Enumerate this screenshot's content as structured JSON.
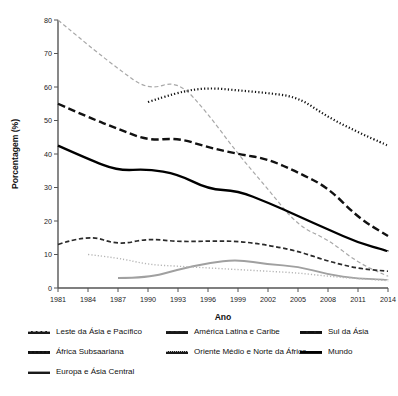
{
  "chart_data": {
    "type": "line",
    "title": "",
    "xlabel": "Ano",
    "ylabel": "Porcentagem (%)",
    "x": [
      1981,
      1984,
      1987,
      1990,
      1993,
      1996,
      1999,
      2002,
      2005,
      2008,
      2011,
      2014
    ],
    "xticklabels": [
      "1981",
      "1984",
      "1987",
      "1990",
      "1993",
      "1996",
      "1999",
      "2002",
      "2005",
      "2008",
      "2011",
      "2014"
    ],
    "yticklabels": [
      "0",
      "10",
      "20",
      "30",
      "40",
      "50",
      "60",
      "70",
      "80"
    ],
    "ylim": [
      0,
      80
    ],
    "xlim": [
      1981,
      2014
    ],
    "ytick_step": 10,
    "grid": false,
    "legend_position": "below",
    "series": [
      {
        "name": "Leste da Ásia e Pacífico",
        "style": "dashed-light",
        "color": "#a8a8a8",
        "x": [
          1981,
          1984,
          1987,
          1990,
          1993,
          1996,
          1999,
          2002,
          2005,
          2008,
          2011,
          2014
        ],
        "values": [
          80.0,
          72.5,
          65.5,
          59.0,
          62.0,
          52.0,
          40.0,
          29.5,
          18.5,
          14.5,
          7.5,
          3.5
        ]
      },
      {
        "name": "África Subsaariana",
        "style": "dotted-dark",
        "color": "#111111",
        "x": [
          1990,
          1993,
          1996,
          1999,
          2002,
          2005,
          2008,
          2011,
          2014
        ],
        "values": [
          55.5,
          58.5,
          59.8,
          59.0,
          58.2,
          57.0,
          51.0,
          46.5,
          42.5
        ]
      },
      {
        "name": "Europa e Ásia Central",
        "style": "solid-gray",
        "color": "#a0a0a0",
        "x": [
          1987,
          1990,
          1993,
          1996,
          1999,
          2002,
          2005,
          2008,
          2011,
          2014
        ],
        "values": [
          3.0,
          3.0,
          5.5,
          7.5,
          8.5,
          7.0,
          6.5,
          4.0,
          2.8,
          2.5
        ]
      },
      {
        "name": "América Latina e Caribe",
        "style": "dashed-dark",
        "color": "#2a2a2a",
        "x": [
          1981,
          1984,
          1987,
          1990,
          1993,
          1996,
          1999,
          2002,
          2005,
          2008,
          2011,
          2014
        ],
        "values": [
          13.0,
          16.0,
          12.8,
          14.8,
          13.8,
          14.0,
          14.0,
          12.8,
          11.0,
          8.0,
          5.8,
          5.0
        ]
      },
      {
        "name": "Oriente Médio e Norte da África",
        "style": "dotted-light",
        "color": "#b5b5b5",
        "x": [
          1984,
          1987,
          1990,
          1993,
          1996,
          1999,
          2002,
          2005,
          2008,
          2011,
          2014
        ],
        "values": [
          10.0,
          9.0,
          7.0,
          6.5,
          6.0,
          5.5,
          5.0,
          4.5,
          3.5,
          2.8,
          2.2
        ]
      },
      {
        "name": "Sul da Ásia",
        "style": "dash-long-dark",
        "color": "#111111",
        "x": [
          1981,
          1984,
          1987,
          1990,
          1993,
          1996,
          1999,
          2002,
          2005,
          2008,
          2011,
          2014
        ],
        "values": [
          55.0,
          51.0,
          47.5,
          44.0,
          44.8,
          42.0,
          40.0,
          38.5,
          34.5,
          30.0,
          21.0,
          15.5
        ]
      },
      {
        "name": "Mundo",
        "style": "solid-dark",
        "color": "#000000",
        "x": [
          1981,
          1984,
          1987,
          1990,
          1993,
          1996,
          1999,
          2002,
          2005,
          2008,
          2011,
          2014
        ],
        "values": [
          42.5,
          38.5,
          35.0,
          35.5,
          34.0,
          29.5,
          29.0,
          25.5,
          21.5,
          17.5,
          13.5,
          11.0
        ]
      }
    ]
  },
  "legend": {
    "rows": [
      [
        {
          "label": "Leste da Ásia e Pacífico",
          "style": "dashed-light",
          "color": "#a8a8a8"
        },
        {
          "label": "América Latina e Caribe",
          "style": "dashed-dark",
          "color": "#2a2a2a"
        },
        {
          "label": "Sul da Ásia",
          "style": "dash-long-dark",
          "color": "#111111"
        }
      ],
      [
        {
          "label": "África Subsaariana",
          "style": "dotted-dark",
          "color": "#111111"
        },
        {
          "label": "Oriente Médio e Norte da África",
          "style": "dotted-light",
          "color": "#b5b5b5"
        },
        {
          "label": "Mundo",
          "style": "solid-dark",
          "color": "#000000"
        }
      ],
      [
        {
          "label": "Europa e Ásia Central",
          "style": "solid-gray",
          "color": "#a0a0a0"
        }
      ]
    ]
  }
}
